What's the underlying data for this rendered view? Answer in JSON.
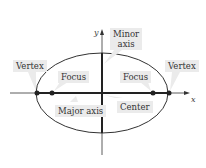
{
  "diagram": {
    "type": "ellipse",
    "axes": {
      "x_label": "x",
      "y_label": "y"
    },
    "labels": {
      "vertex_left": "Vertex",
      "vertex_right": "Vertex",
      "focus_left": "Focus",
      "focus_right": "Focus",
      "minor_axis_line1": "Minor",
      "minor_axis_line2": "axis",
      "major_axis": "Major axis",
      "center": "Center"
    },
    "colors": {
      "stroke": "#222222",
      "label_bg": "#ebebeb"
    }
  }
}
